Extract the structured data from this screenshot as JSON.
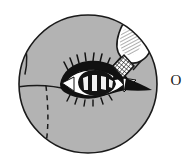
{
  "figure": {
    "label": "O",
    "label_position": "right-of-circle",
    "background_color": "#ffffff"
  },
  "inset_circle": {
    "name": "magnified-view-circle",
    "center_x": 88,
    "center_y": 84,
    "radius": 69,
    "fill_color": "#b3b3b3",
    "stroke_color": "#1a1a1a",
    "stroke_width": 1.6
  },
  "face_contours": [
    {
      "name": "nose-bridge-line",
      "style": "solid",
      "stroke_color": "#1a1a1a"
    },
    {
      "name": "lower-lid-cheek-line",
      "style": "solid",
      "stroke_color": "#1a1a1a"
    },
    {
      "name": "nasolabial-dashed-line",
      "style": "dashed",
      "stroke_color": "#1a1a1a"
    }
  ],
  "eye": {
    "name": "open-eye",
    "lash_color": "#111111",
    "sclera_color": "#ffffff",
    "iris_color": "#141414",
    "highlight_color": "#f2f2f2",
    "medial_canthus": "white-triangle-left",
    "lateral_canthus": "white-triangle-right"
  },
  "dropper": {
    "name": "eye-drop-bottle",
    "body_color": "#ffffff",
    "outline_color": "#1a1a1a",
    "hatch_color": "#2b2b2b",
    "tip_pattern": "cross-hatch",
    "tip_color": "#1c1c1c",
    "orientation": "angled-down-left"
  },
  "colors": {
    "skin_gray": "#b3b3b3",
    "ink_black": "#1a1a1a",
    "paper_white": "#ffffff"
  }
}
